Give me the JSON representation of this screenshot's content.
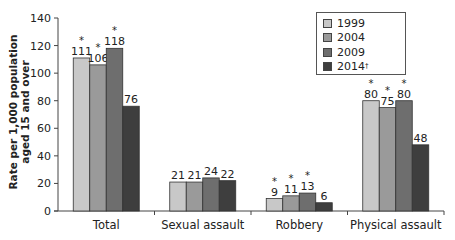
{
  "chart_data": {
    "type": "bar",
    "title": "",
    "xlabel": "",
    "ylabel": "Rate per 1,000 population aged 15 and over",
    "ylabel_lines": [
      "Rate per 1,000 population",
      "aged 15 and over"
    ],
    "ylim": [
      0,
      140
    ],
    "yticks": [
      0,
      20,
      40,
      60,
      80,
      100,
      120,
      140
    ],
    "grid": false,
    "legend_position": "upper right (inside, boxed)",
    "categories": [
      "Total",
      "Sexual assault",
      "Robbery",
      "Physical assault"
    ],
    "series": [
      {
        "name": "1999",
        "legend_label": "1999",
        "color": "#c8c8c8",
        "values": [
          111,
          21,
          9,
          80
        ],
        "significant": [
          true,
          false,
          true,
          true
        ]
      },
      {
        "name": "2004",
        "legend_label": "2004",
        "color": "#9a9a9a",
        "values": [
          106,
          21,
          11,
          75
        ],
        "significant": [
          true,
          false,
          true,
          true
        ]
      },
      {
        "name": "2009",
        "legend_label": "2009",
        "color": "#6e6e6e",
        "values": [
          118,
          24,
          13,
          80
        ],
        "significant": [
          true,
          false,
          true,
          true
        ]
      },
      {
        "name": "2014†",
        "legend_label": "2014",
        "legend_sup": "†",
        "color": "#3e3e3e",
        "values": [
          76,
          22,
          6,
          48
        ],
        "significant": [
          false,
          false,
          false,
          false
        ]
      }
    ],
    "annotations": {
      "significance_marker": "*",
      "reference_marker": "†"
    }
  }
}
